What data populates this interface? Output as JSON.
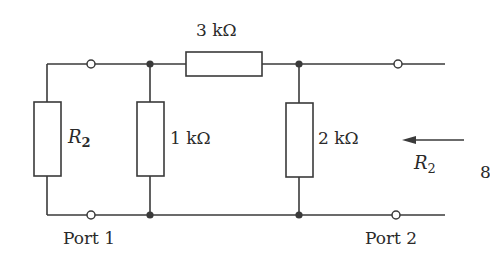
{
  "diagram": {
    "type": "circuit",
    "labels": {
      "top_resistor": "3 kΩ",
      "middle_resistor": "1 kΩ",
      "right_resistor": "2 kΩ",
      "left_resistor_symbol": "R",
      "left_resistor_sub": "2",
      "arrow_label_symbol": "R",
      "arrow_label_sub": "2",
      "port1": "Port 1",
      "port2": "Port 2",
      "page_mark": "8"
    },
    "components": [
      {
        "id": "R_left",
        "label": "R2",
        "orientation": "vertical"
      },
      {
        "id": "R_1k",
        "label": "1 kΩ",
        "orientation": "vertical"
      },
      {
        "id": "R_3k",
        "label": "3 kΩ",
        "orientation": "horizontal"
      },
      {
        "id": "R_2k",
        "label": "2 kΩ",
        "orientation": "vertical"
      }
    ],
    "colors": {
      "line": "#3a3a3a",
      "background": "#ffffff"
    }
  }
}
